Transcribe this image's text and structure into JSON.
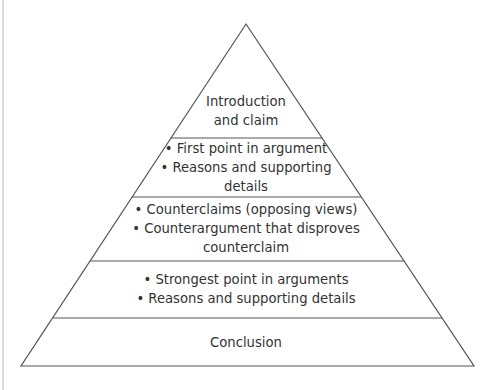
{
  "diagram": {
    "type": "pyramid",
    "colors": {
      "stroke": "#555555",
      "background": "#ffffff",
      "text": "#333333"
    },
    "levels": [
      {
        "id": "introduction",
        "lines": [
          "Introduction",
          "and claim"
        ]
      },
      {
        "id": "first-point",
        "lines": [
          "• First point in argument",
          "• Reasons and supporting",
          "details"
        ]
      },
      {
        "id": "counterclaims",
        "lines": [
          "• Counterclaims (opposing views)",
          "• Counterargument that disproves",
          "counterclaim"
        ]
      },
      {
        "id": "strongest-point",
        "lines": [
          "• Strongest point in arguments",
          "• Reasons and supporting details"
        ]
      },
      {
        "id": "conclusion",
        "lines": [
          "Conclusion"
        ]
      }
    ]
  }
}
